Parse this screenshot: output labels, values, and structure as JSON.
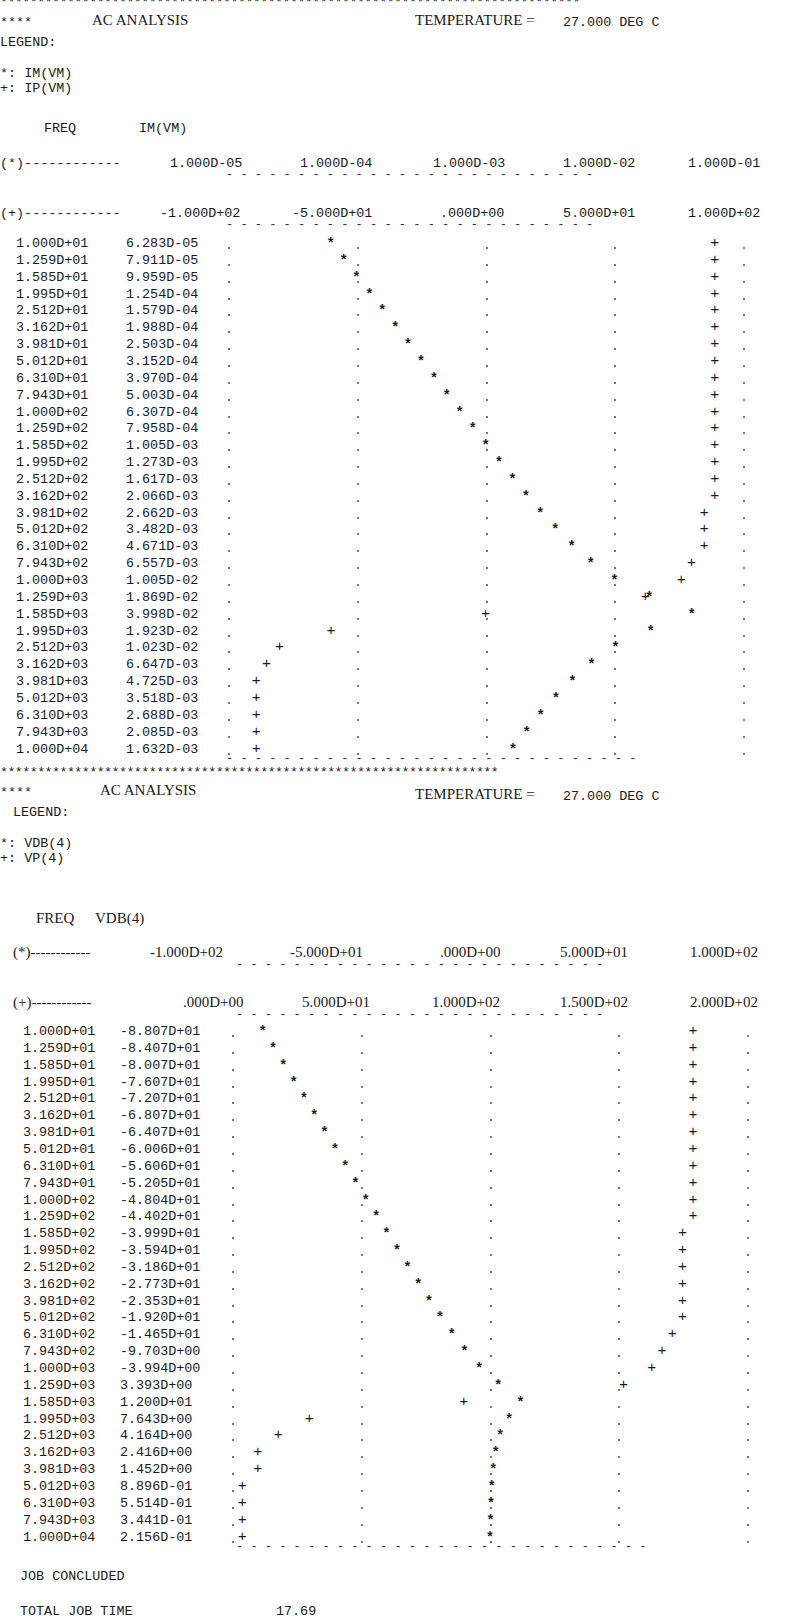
{
  "sections": [
    {
      "banner": "******************************************************************************",
      "prefix": "****",
      "title": "AC ANALYSIS",
      "temperature_label": "TEMPERATURE =",
      "temperature_value": "27.000 DEG C",
      "legend_label": "LEGEND:",
      "legend": [
        {
          "symbol": "*:",
          "name": "IM(VM)"
        },
        {
          "symbol": "+:",
          "name": "IP(VM)"
        }
      ],
      "col_freq": "FREQ",
      "col_value": "IM(VM)",
      "axis_star_prefix": "(*)------------",
      "axis_star_ticks": [
        "1.000D-05",
        "1.000D-04",
        "1.000D-03",
        "1.000D-02",
        "1.000D-01"
      ],
      "axis_plus_prefix": "(+)------------",
      "axis_plus_ticks": [
        "-1.000D+02",
        "-5.000D+01",
        ".000D+00",
        "5.000D+01",
        "1.000D+02"
      ],
      "rows": [
        {
          "freq": "1.000D+01",
          "value": "6.283D-05"
        },
        {
          "freq": "1.259D+01",
          "value": "7.911D-05"
        },
        {
          "freq": "1.585D+01",
          "value": "9.959D-05"
        },
        {
          "freq": "1.995D+01",
          "value": "1.254D-04"
        },
        {
          "freq": "2.512D+01",
          "value": "1.579D-04"
        },
        {
          "freq": "3.162D+01",
          "value": "1.988D-04"
        },
        {
          "freq": "3.981D+01",
          "value": "2.503D-04"
        },
        {
          "freq": "5.012D+01",
          "value": "3.152D-04"
        },
        {
          "freq": "6.310D+01",
          "value": "3.970D-04"
        },
        {
          "freq": "7.943D+01",
          "value": "5.003D-04"
        },
        {
          "freq": "1.000D+02",
          "value": "6.307D-04"
        },
        {
          "freq": "1.259D+02",
          "value": "7.958D-04"
        },
        {
          "freq": "1.585D+02",
          "value": "1.005D-03"
        },
        {
          "freq": "1.995D+02",
          "value": "1.273D-03"
        },
        {
          "freq": "2.512D+02",
          "value": "1.617D-03"
        },
        {
          "freq": "3.162D+02",
          "value": "2.066D-03"
        },
        {
          "freq": "3.981D+02",
          "value": "2.662D-03"
        },
        {
          "freq": "5.012D+02",
          "value": "3.482D-03"
        },
        {
          "freq": "6.310D+02",
          "value": "4.671D-03"
        },
        {
          "freq": "7.943D+02",
          "value": "6.557D-03"
        },
        {
          "freq": "1.000D+03",
          "value": "1.005D-02"
        },
        {
          "freq": "1.259D+03",
          "value": "1.869D-02"
        },
        {
          "freq": "1.585D+03",
          "value": "3.998D-02"
        },
        {
          "freq": "1.995D+03",
          "value": "1.923D-02"
        },
        {
          "freq": "2.512D+03",
          "value": "1.023D-02"
        },
        {
          "freq": "3.162D+03",
          "value": "6.647D-03"
        },
        {
          "freq": "3.981D+03",
          "value": "4.725D-03"
        },
        {
          "freq": "5.012D+03",
          "value": "3.518D-03"
        },
        {
          "freq": "6.310D+03",
          "value": "2.688D-03"
        },
        {
          "freq": "7.943D+03",
          "value": "2.085D-03"
        },
        {
          "freq": "1.000D+04",
          "value": "1.632D-03"
        }
      ]
    },
    {
      "banner": "*******************************************************************",
      "prefix": "****",
      "title": "AC ANALYSIS",
      "temperature_label": "TEMPERATURE =",
      "temperature_value": "27.000 DEG C",
      "legend_label": "LEGEND:",
      "legend": [
        {
          "symbol": "*:",
          "name": "VDB(4)"
        },
        {
          "symbol": "+:",
          "name": "VP(4)"
        }
      ],
      "col_freq": "FREQ",
      "col_value": "VDB(4)",
      "axis_star_prefix": "(*)------------",
      "axis_star_ticks": [
        "-1.000D+02",
        "-5.000D+01",
        ".000D+00",
        "5.000D+01",
        "1.000D+02"
      ],
      "axis_plus_prefix": "(+)------------",
      "axis_plus_ticks": [
        ".000D+00",
        "5.000D+01",
        "1.000D+02",
        "1.500D+02",
        "2.000D+02"
      ],
      "rows": [
        {
          "freq": "1.000D+01",
          "value": "-8.807D+01"
        },
        {
          "freq": "1.259D+01",
          "value": "-8.407D+01"
        },
        {
          "freq": "1.585D+01",
          "value": "-8.007D+01"
        },
        {
          "freq": "1.995D+01",
          "value": "-7.607D+01"
        },
        {
          "freq": "2.512D+01",
          "value": "-7.207D+01"
        },
        {
          "freq": "3.162D+01",
          "value": "-6.807D+01"
        },
        {
          "freq": "3.981D+01",
          "value": "-6.407D+01"
        },
        {
          "freq": "5.012D+01",
          "value": "-6.006D+01"
        },
        {
          "freq": "6.310D+01",
          "value": "-5.606D+01"
        },
        {
          "freq": "7.943D+01",
          "value": "-5.205D+01"
        },
        {
          "freq": "1.000D+02",
          "value": "-4.804D+01"
        },
        {
          "freq": "1.259D+02",
          "value": "-4.402D+01"
        },
        {
          "freq": "1.585D+02",
          "value": "-3.999D+01"
        },
        {
          "freq": "1.995D+02",
          "value": "-3.594D+01"
        },
        {
          "freq": "2.512D+02",
          "value": "-3.186D+01"
        },
        {
          "freq": "3.162D+02",
          "value": "-2.773D+01"
        },
        {
          "freq": "3.981D+02",
          "value": "-2.353D+01"
        },
        {
          "freq": "5.012D+02",
          "value": "-1.920D+01"
        },
        {
          "freq": "6.310D+02",
          "value": "-1.465D+01"
        },
        {
          "freq": "7.943D+02",
          "value": "-9.703D+00"
        },
        {
          "freq": "1.000D+03",
          "value": "-3.994D+00"
        },
        {
          "freq": "1.259D+03",
          "value": "3.393D+00"
        },
        {
          "freq": "1.585D+03",
          "value": "1.200D+01"
        },
        {
          "freq": "1.995D+03",
          "value": "7.643D+00"
        },
        {
          "freq": "2.512D+03",
          "value": "4.164D+00"
        },
        {
          "freq": "3.162D+03",
          "value": "2.416D+00"
        },
        {
          "freq": "3.981D+03",
          "value": "1.452D+00"
        },
        {
          "freq": "5.012D+03",
          "value": "8.896D-01"
        },
        {
          "freq": "6.310D+03",
          "value": "5.514D-01"
        },
        {
          "freq": "7.943D+03",
          "value": "3.441D-01"
        },
        {
          "freq": "1.000D+04",
          "value": "2.156D-01"
        }
      ]
    }
  ],
  "footer": {
    "job_concluded": "JOB CONCLUDED",
    "total_job_time_label": "TOTAL JOB TIME",
    "total_job_time_value": "17.69"
  },
  "chart_data": [
    {
      "type": "scatter",
      "title": "AC ANALYSIS — IM(VM) / IP(VM)",
      "xlabel": "FREQ (Hz)",
      "x": [
        10,
        12.59,
        15.85,
        19.95,
        25.12,
        31.62,
        39.81,
        50.12,
        63.1,
        79.43,
        100,
        125.9,
        158.5,
        199.5,
        251.2,
        316.2,
        398.1,
        501.2,
        631.0,
        794.3,
        1000,
        1259,
        1585,
        1995,
        2512,
        3162,
        3981,
        5012,
        6310,
        7943,
        10000
      ],
      "series": [
        {
          "name": "IM(VM)",
          "symbol": "*",
          "scale": "log",
          "range": [
            1e-05,
            0.1
          ],
          "values": [
            6.283e-05,
            7.911e-05,
            9.959e-05,
            0.0001254,
            0.0001579,
            0.0001988,
            0.0002503,
            0.0003152,
            0.000397,
            0.0005003,
            0.0006307,
            0.0007958,
            0.001005,
            0.001273,
            0.001617,
            0.002066,
            0.002662,
            0.003482,
            0.004671,
            0.006557,
            0.01005,
            0.01869,
            0.03998,
            0.01923,
            0.01023,
            0.006647,
            0.004725,
            0.003518,
            0.002688,
            0.002085,
            0.001632
          ]
        },
        {
          "name": "IP(VM)",
          "symbol": "+",
          "scale": "linear",
          "range": [
            -100,
            100
          ],
          "values": [
            89,
            89,
            89,
            89,
            89,
            89,
            89,
            89,
            89,
            89,
            89,
            89,
            89,
            89,
            89,
            89,
            85,
            85,
            85,
            80,
            76,
            62,
            0,
            -60,
            -80,
            -85,
            -89,
            -89,
            -89,
            -89,
            -89
          ]
        }
      ],
      "ticks_star": [
        "1.000D-05",
        "1.000D-04",
        "1.000D-03",
        "1.000D-02",
        "1.000D-01"
      ],
      "ticks_plus": [
        "-1.000D+02",
        "-5.000D+01",
        ".000D+00",
        "5.000D+01",
        "1.000D+02"
      ],
      "legend": [
        "*: IM(VM)",
        "+: IP(VM)"
      ]
    },
    {
      "type": "scatter",
      "title": "AC ANALYSIS — VDB(4) / VP(4)",
      "xlabel": "FREQ (Hz)",
      "x": [
        10,
        12.59,
        15.85,
        19.95,
        25.12,
        31.62,
        39.81,
        50.12,
        63.1,
        79.43,
        100,
        125.9,
        158.5,
        199.5,
        251.2,
        316.2,
        398.1,
        501.2,
        631.0,
        794.3,
        1000,
        1259,
        1585,
        1995,
        2512,
        3162,
        3981,
        5012,
        6310,
        7943,
        10000
      ],
      "series": [
        {
          "name": "VDB(4)",
          "symbol": "*",
          "scale": "linear",
          "range": [
            -100,
            100
          ],
          "values": [
            -88.07,
            -84.07,
            -80.07,
            -76.07,
            -72.07,
            -68.07,
            -64.07,
            -60.06,
            -56.06,
            -52.05,
            -48.04,
            -44.02,
            -39.99,
            -35.94,
            -31.86,
            -27.73,
            -23.53,
            -19.2,
            -14.65,
            -9.703,
            -3.994,
            3.393,
            12.0,
            7.643,
            4.164,
            2.416,
            1.452,
            0.8896,
            0.5514,
            0.3441,
            0.2156
          ]
        },
        {
          "name": "VP(4)",
          "symbol": "+",
          "scale": "linear",
          "range": [
            0,
            200
          ],
          "values": [
            179,
            179,
            179,
            179,
            179,
            179,
            179,
            179,
            179,
            179,
            179,
            179,
            175,
            175,
            175,
            175,
            175,
            175,
            171,
            167,
            163,
            152,
            90,
            30,
            18,
            10,
            10,
            4,
            4,
            4,
            4
          ]
        }
      ],
      "ticks_star": [
        "-1.000D+02",
        "-5.000D+01",
        ".000D+00",
        "5.000D+01",
        "1.000D+02"
      ],
      "ticks_plus": [
        ".000D+00",
        "5.000D+01",
        "1.000D+02",
        "1.500D+02",
        "2.000D+02"
      ],
      "legend": [
        "*: VDB(4)",
        "+: VP(4)"
      ]
    }
  ]
}
